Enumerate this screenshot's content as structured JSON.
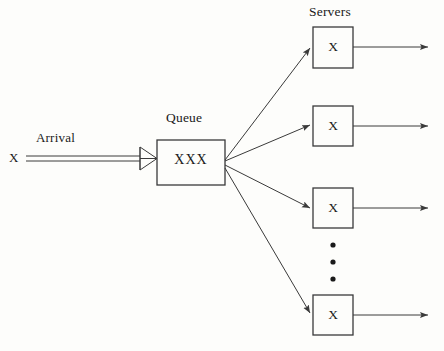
{
  "diagram": {
    "title_labels": {
      "servers": "Servers",
      "queue": "Queue",
      "arrival": "Arrival"
    },
    "source": {
      "symbol": "X"
    },
    "queue_box": {
      "content": "XXX",
      "x": 157,
      "y": 140,
      "width": 68,
      "height": 45
    },
    "servers": [
      {
        "symbol": "X",
        "x": 313,
        "y": 27,
        "width": 40,
        "height": 41
      },
      {
        "symbol": "X",
        "x": 313,
        "y": 106,
        "width": 40,
        "height": 40
      },
      {
        "symbol": "X",
        "x": 313,
        "y": 188,
        "width": 40,
        "height": 40
      },
      {
        "symbol": "X",
        "x": 313,
        "y": 295,
        "width": 40,
        "height": 40
      }
    ],
    "ellipsis": {
      "dots": 3,
      "x": 333,
      "ys": [
        245,
        262,
        279
      ]
    },
    "colors": {
      "stroke": "#3a3a3a",
      "text": "#1a1a1a",
      "background": "#fdfdfb"
    },
    "fan_out_origin": {
      "x": 225,
      "y": 162
    },
    "departure_arrow_end_x": 428
  }
}
